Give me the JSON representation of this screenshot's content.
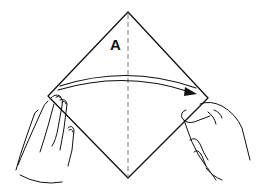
{
  "diagram": {
    "type": "origami-fold-instruction",
    "labels": {
      "flap": "A"
    },
    "paper": {
      "shape": "square rotated 45 degrees (diamond)",
      "vertices": {
        "top": [
          128,
          12
        ],
        "right": [
          208,
          98
        ],
        "bottom": [
          128,
          178
        ],
        "left": [
          48,
          96
        ]
      }
    },
    "fold_line": {
      "style": "dashed",
      "orientation": "vertical",
      "from": [
        128,
        14
      ],
      "to": [
        128,
        176
      ]
    },
    "arrow": {
      "direction": "left-to-right",
      "meaning": "fold left corner over to right corner",
      "from": [
        58,
        90
      ],
      "to": [
        195,
        93
      ]
    },
    "hands": [
      {
        "side": "left",
        "role": "holding left corner"
      },
      {
        "side": "right",
        "role": "holding right corner"
      }
    ],
    "colors": {
      "line": "#111111",
      "background": "#ffffff",
      "fold_line": "#888888"
    }
  }
}
